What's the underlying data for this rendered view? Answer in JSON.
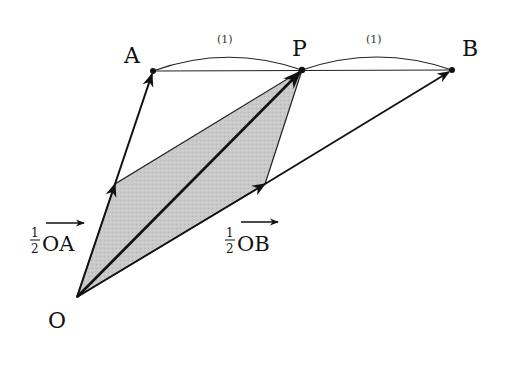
{
  "diagram": {
    "points": {
      "O": {
        "label": "O",
        "x": 77,
        "y": 297
      },
      "A": {
        "label": "A",
        "x": 153,
        "y": 71
      },
      "P": {
        "label": "P",
        "x": 302,
        "y": 70
      },
      "B": {
        "label": "B",
        "x": 452,
        "y": 70
      }
    },
    "segment_ratios": {
      "AP": "(1)",
      "PB": "(1)"
    },
    "vector_labels": {
      "half_OA": {
        "coef_num": "1",
        "coef_den": "2",
        "vector": "OA"
      },
      "half_OB": {
        "coef_num": "1",
        "coef_den": "2",
        "vector": "OB"
      }
    },
    "colors": {
      "stroke": "#111111",
      "fill_parallelogram": "#c8c8c8",
      "background": "#ffffff"
    }
  }
}
